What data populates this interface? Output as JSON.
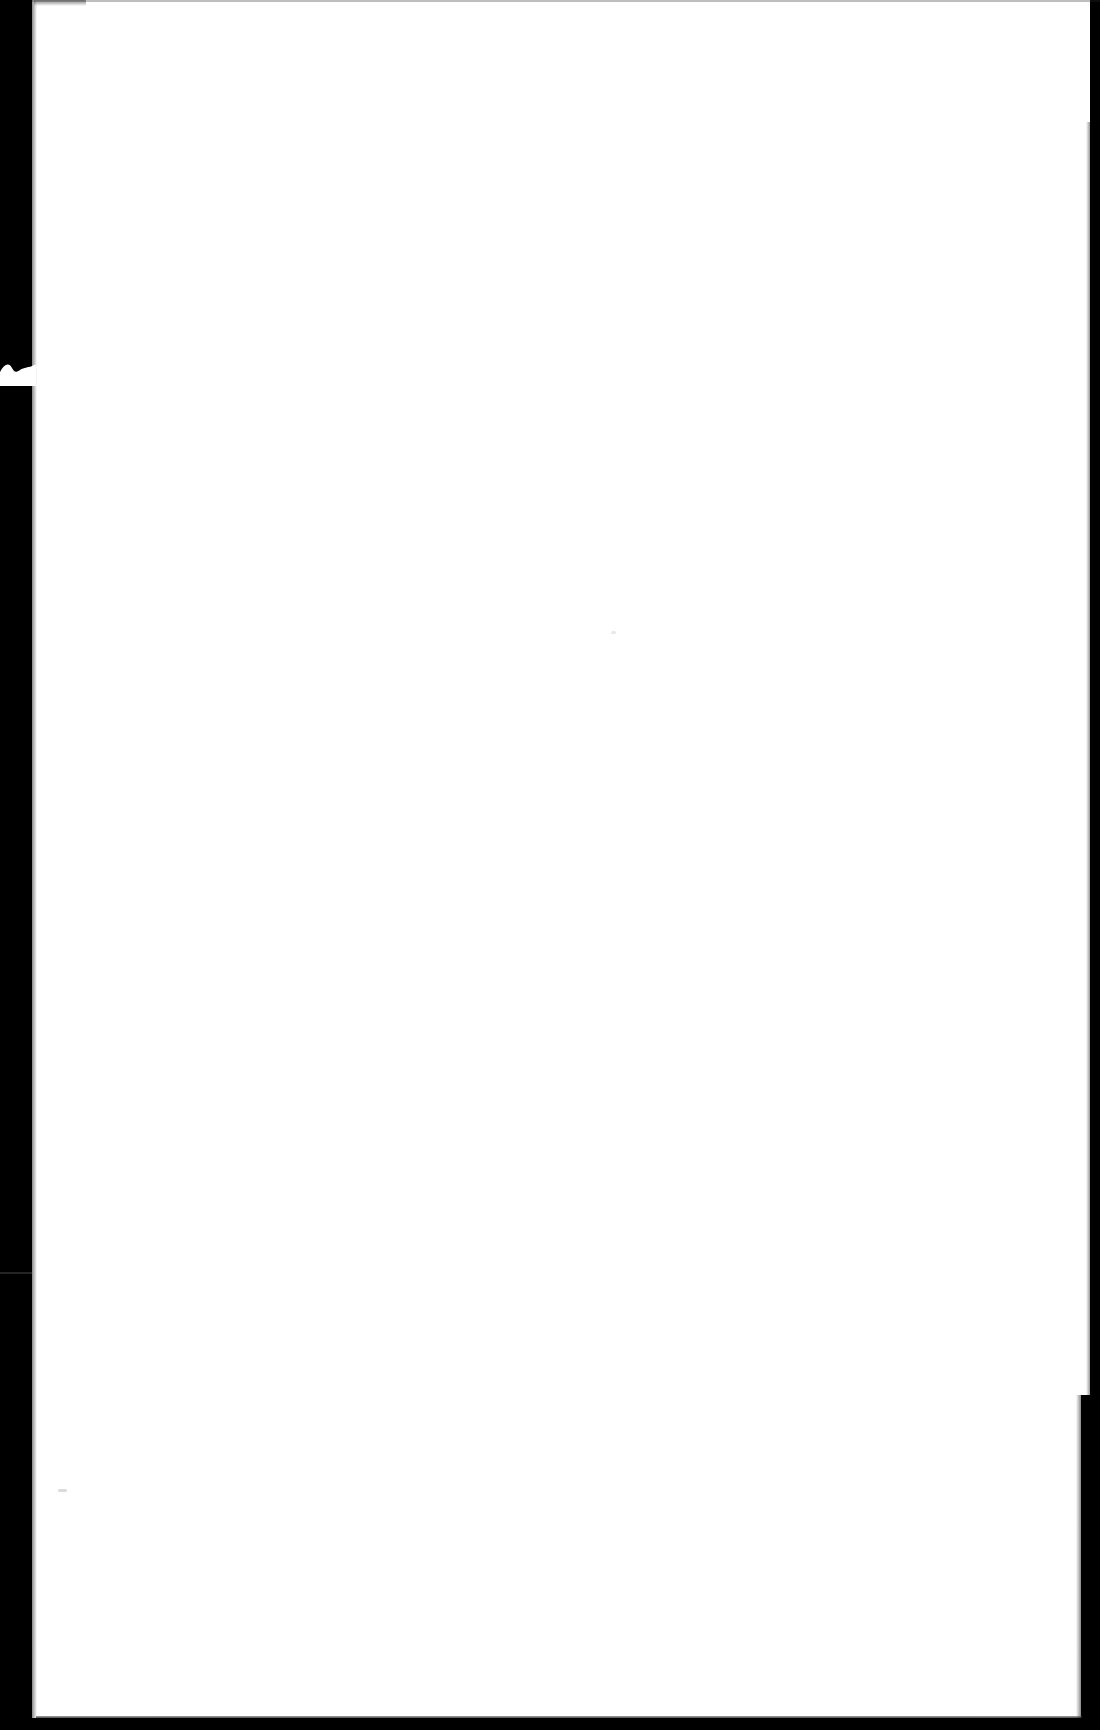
{
  "document": {
    "type": "scanned-page",
    "title": "Scanned blank page",
    "page_content_text": "",
    "is_blank": true,
    "visible_text_lines": []
  },
  "canvas": {
    "width_px": 1100,
    "height_px": 1730,
    "background_color": "#000000"
  },
  "paper": {
    "name": "paper-sheet",
    "color": "#ffffff",
    "left_px": 32,
    "top_px": 0,
    "width_px": 1058,
    "height_px": 1722
  },
  "scan_edges": {
    "left_margin": {
      "label": "left scanner margin",
      "color": "#000000",
      "left_px": 0,
      "top_px": 0,
      "width_px": 32,
      "height_px": 1730
    },
    "right_margin": {
      "label": "right scanner margin",
      "color": "#000000",
      "top_px": 122,
      "width_px": 10,
      "height_px": 1608
    },
    "right_margin_wide": {
      "label": "right scanner margin (lower, wider)",
      "color": "#000000",
      "top_px": 1395,
      "width_px": 19,
      "height_px": 335
    },
    "bottom_margin": {
      "label": "bottom scanner edge",
      "color": "#000000",
      "top_px": 1718,
      "height_px": 12
    },
    "top_hairline": {
      "label": "top paper hairline",
      "color": "#282828"
    }
  },
  "artifacts": {
    "notch": {
      "label": "torn notch in left margin",
      "color": "#ffffff",
      "left_px": 0,
      "top_px": 352,
      "width_px": 36,
      "height_px": 34
    },
    "seam_left": {
      "label": "horizontal seam in left black band",
      "color": "#787878",
      "top_px": 1272
    },
    "smudge_top_left": {
      "label": "gray smudge at top edge",
      "color": "#464646",
      "left_px": 34,
      "top_px": 0
    },
    "speck_lower_left": {
      "label": "faint speck lower left",
      "color": "#bebebe",
      "left_px": 58,
      "top_px": 1489
    },
    "speck_center": {
      "label": "faint speck center",
      "color": "#d6d6d6",
      "left_px": 611,
      "top_px": 631
    }
  }
}
